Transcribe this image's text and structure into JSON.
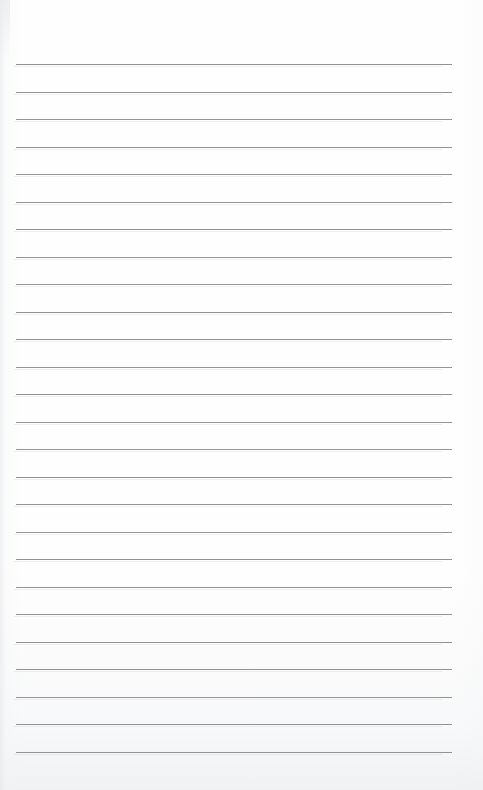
{
  "document": {
    "kind": "lined-notepad-page",
    "title": "",
    "body_text": "",
    "page_width": 483,
    "page_height": 790,
    "background_color": "#fefefe"
  },
  "ruling": {
    "line_color": "#8d8d91",
    "line_thickness_px": 1,
    "line_count": 26,
    "left_margin_px": 16,
    "right_edge_px": 452,
    "first_line_y_px": 64,
    "line_spacing_px": 27.5,
    "last_line_y_px": 752,
    "lines_y": [
      64,
      91.5,
      119,
      146.5,
      174,
      201.5,
      229,
      256.5,
      284,
      311.5,
      339,
      366.5,
      394,
      421.5,
      449,
      476.5,
      504,
      531.5,
      559,
      586.5,
      614,
      641.5,
      669,
      696.5,
      724,
      751.5
    ]
  }
}
